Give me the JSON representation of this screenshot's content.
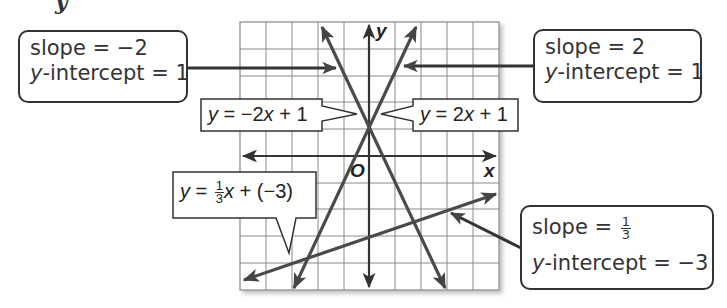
{
  "figure": {
    "partial_heading_glyph": "y",
    "grid": {
      "x_range": [
        -5,
        5
      ],
      "y_range": [
        -5,
        5
      ],
      "cells": 10
    },
    "axes": {
      "x_label": "x",
      "y_label": "y",
      "origin_label": "O"
    },
    "lines": [
      {
        "id": "line-neg2",
        "equation_parts": {
          "lhs": "y",
          "eq": " = ",
          "rhs_pre": "−2",
          "var": "x",
          "rhs_post": " + 1"
        },
        "slope": -2,
        "intercept": 1,
        "color": "#4a4a4a"
      },
      {
        "id": "line-pos2",
        "equation_parts": {
          "lhs": "y",
          "eq": " = ",
          "rhs_pre": "2",
          "var": "x",
          "rhs_post": " + 1"
        },
        "slope": 2,
        "intercept": 1,
        "color": "#4a4a4a"
      },
      {
        "id": "line-third",
        "equation_parts": {
          "lhs": "y",
          "eq": " = ",
          "frac_num": "1",
          "frac_den": "3",
          "var": "x",
          "rhs_post": " + (−3)"
        },
        "slope": "1/3",
        "intercept": -3,
        "color": "#4a4a4a"
      }
    ],
    "callouts": {
      "top_left": {
        "slope_label": "slope = −2",
        "intercept_var": "y",
        "intercept_label": "-intercept = 1"
      },
      "top_right": {
        "slope_label": "slope = 2",
        "intercept_var": "y",
        "intercept_label": "-intercept = 1"
      },
      "bottom_right": {
        "slope_prefix": "slope = ",
        "slope_num": "1",
        "slope_den": "3",
        "intercept_var": "y",
        "intercept_label": "-intercept = −3"
      }
    }
  }
}
